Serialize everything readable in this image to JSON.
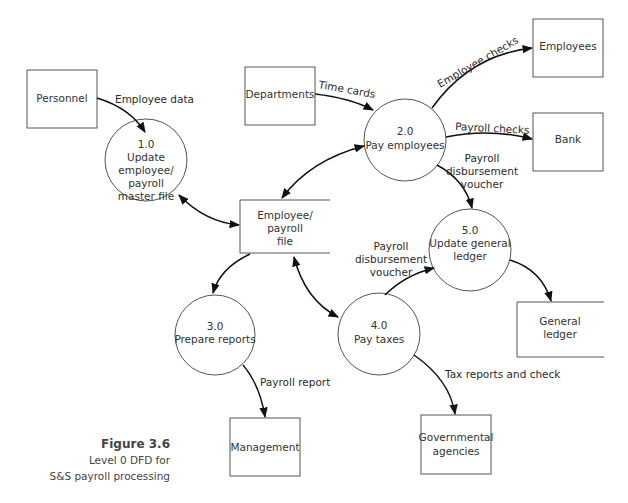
{
  "diagram": {
    "type": "data-flow-diagram",
    "level": "Level 0",
    "external_entities": [
      {
        "id": "personnel",
        "label": "Personnel"
      },
      {
        "id": "departments",
        "label": "Departments"
      },
      {
        "id": "employees",
        "label": "Employees"
      },
      {
        "id": "bank",
        "label": "Bank"
      },
      {
        "id": "management",
        "label": "Management"
      },
      {
        "id": "governmental",
        "label_lines": [
          "Governmental",
          "agencies"
        ]
      }
    ],
    "processes": [
      {
        "id": "p1",
        "number": "1.0",
        "label_lines": [
          "Update",
          "employee/",
          "payroll",
          "master file"
        ]
      },
      {
        "id": "p2",
        "number": "2.0",
        "label_lines": [
          "Pay employees"
        ]
      },
      {
        "id": "p3",
        "number": "3.0",
        "label_lines": [
          "Prepare reports"
        ]
      },
      {
        "id": "p4",
        "number": "4.0",
        "label_lines": [
          "Pay taxes"
        ]
      },
      {
        "id": "p5",
        "number": "5.0",
        "label_lines": [
          "Update general",
          "ledger"
        ]
      }
    ],
    "data_stores": [
      {
        "id": "emp_file",
        "label_lines": [
          "Employee/",
          "payroll",
          "file"
        ]
      },
      {
        "id": "gl",
        "label_lines": [
          "General",
          "ledger"
        ]
      }
    ],
    "flows": [
      {
        "from": "personnel",
        "to": "p1",
        "label": "Employee data"
      },
      {
        "from": "departments",
        "to": "p2",
        "label": "Time cards"
      },
      {
        "from": "p2",
        "to": "employees",
        "label": "Employee checks"
      },
      {
        "from": "p2",
        "to": "bank",
        "label": "Payroll checks"
      },
      {
        "from": "p2",
        "to": "p5",
        "label_lines": [
          "Payroll",
          "disbursement",
          "voucher"
        ]
      },
      {
        "from": "p4",
        "to": "p5",
        "label_lines": [
          "Payroll",
          "disbursement",
          "voucher"
        ]
      },
      {
        "from": "p5",
        "to": "gl",
        "label": ""
      },
      {
        "from": "p1",
        "to": "emp_file",
        "label": "",
        "bidirectional": true
      },
      {
        "from": "p2",
        "to": "emp_file",
        "label": "",
        "bidirectional": true
      },
      {
        "from": "emp_file",
        "to": "p3",
        "label": ""
      },
      {
        "from": "emp_file",
        "to": "p4",
        "label": "",
        "bidirectional": true
      },
      {
        "from": "p3",
        "to": "management",
        "label": "Payroll report"
      },
      {
        "from": "p4",
        "to": "governmental",
        "label": "Tax reports and check"
      }
    ]
  },
  "caption": {
    "figure": "Figure 3.6",
    "line1": "Level 0 DFD for",
    "line2": "S&S payroll processing"
  },
  "colors": {
    "stroke": "#555555",
    "arrow": "#111111",
    "background": "#ffffff"
  }
}
